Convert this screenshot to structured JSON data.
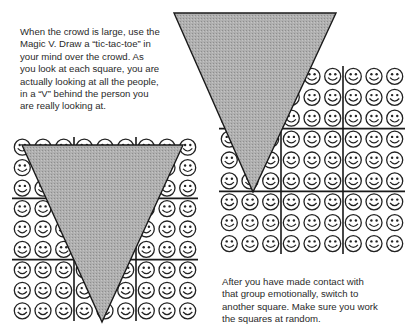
{
  "paragraphs": {
    "top": "When the crowd is large, use the\nMagic V. Draw a “tic-tac-toe” in\nyour mind over the crowd. As\nyou look at each square, you are\nactually looking at all the people,\nin a “V” behind the person you\nare really looking at.",
    "bottom": "After you have made contact with\nthat group emotionally, switch to\nanother square. Make sure you work\nthe squares at random."
  },
  "figures": [
    {
      "name": "crowd-grid-left",
      "rows": 9,
      "cols": 9,
      "sections": 3,
      "face_icon": "smiley-face-icon",
      "triangle_color": "#a9a9a9"
    },
    {
      "name": "crowd-grid-right",
      "rows": 9,
      "cols": 9,
      "sections": 3,
      "face_icon": "smiley-face-icon",
      "triangle_color": "#a9a9a9"
    }
  ],
  "colors": {
    "ink": "#222222",
    "triangle_fill": "#a9a9a9",
    "triangle_stroke": "#1a1a1a"
  }
}
